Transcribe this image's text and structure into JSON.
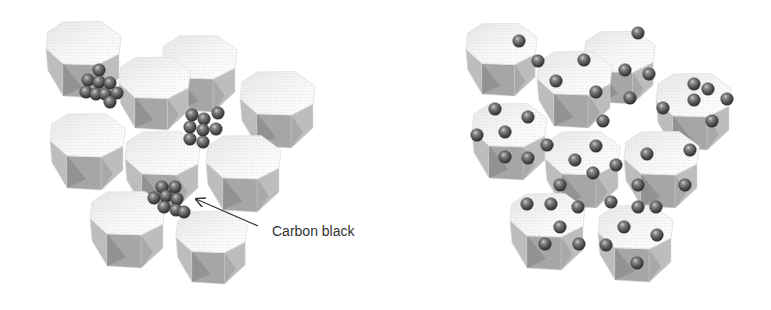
{
  "figure": {
    "annotation": {
      "label": "Carbon black"
    },
    "panels": [
      {
        "id": "agglomerated",
        "particles": [
          {
            "cx": 84,
            "cy": 58,
            "r": 40
          },
          {
            "cx": 200,
            "cy": 72,
            "r": 40
          },
          {
            "cx": 155,
            "cy": 92,
            "r": 38
          },
          {
            "cx": 278,
            "cy": 108,
            "r": 40
          },
          {
            "cx": 88,
            "cy": 150,
            "r": 40
          },
          {
            "cx": 163,
            "cy": 168,
            "r": 40
          },
          {
            "cx": 244,
            "cy": 172,
            "r": 40
          },
          {
            "cx": 128,
            "cy": 228,
            "r": 40
          },
          {
            "cx": 212,
            "cy": 246,
            "r": 38
          }
        ],
        "carbon_black": [
          {
            "x": 99,
            "y": 70
          },
          {
            "x": 88,
            "y": 80
          },
          {
            "x": 99,
            "y": 82
          },
          {
            "x": 110,
            "y": 83
          },
          {
            "x": 86,
            "y": 92
          },
          {
            "x": 96,
            "y": 94
          },
          {
            "x": 105,
            "y": 94
          },
          {
            "x": 117,
            "y": 93
          },
          {
            "x": 110,
            "y": 102
          },
          {
            "x": 192,
            "y": 115
          },
          {
            "x": 204,
            "y": 119
          },
          {
            "x": 218,
            "y": 113
          },
          {
            "x": 190,
            "y": 127
          },
          {
            "x": 203,
            "y": 130
          },
          {
            "x": 216,
            "y": 129
          },
          {
            "x": 190,
            "y": 139
          },
          {
            "x": 203,
            "y": 142
          },
          {
            "x": 162,
            "y": 187
          },
          {
            "x": 175,
            "y": 187
          },
          {
            "x": 154,
            "y": 198
          },
          {
            "x": 166,
            "y": 196
          },
          {
            "x": 177,
            "y": 199
          },
          {
            "x": 164,
            "y": 207
          },
          {
            "x": 176,
            "y": 210
          },
          {
            "x": 184,
            "y": 212
          }
        ]
      },
      {
        "id": "dispersed",
        "particles": [
          {
            "cx": 502,
            "cy": 58,
            "r": 38
          },
          {
            "cx": 620,
            "cy": 66,
            "r": 38
          },
          {
            "cx": 575,
            "cy": 88,
            "r": 40
          },
          {
            "cx": 694,
            "cy": 110,
            "r": 40
          },
          {
            "cx": 510,
            "cy": 140,
            "r": 40
          },
          {
            "cx": 583,
            "cy": 168,
            "r": 40
          },
          {
            "cx": 662,
            "cy": 168,
            "r": 40
          },
          {
            "cx": 548,
            "cy": 230,
            "r": 40
          },
          {
            "cx": 636,
            "cy": 242,
            "r": 40
          }
        ],
        "carbon_black": [
          {
            "x": 519,
            "y": 41
          },
          {
            "x": 638,
            "y": 33
          },
          {
            "x": 538,
            "y": 61
          },
          {
            "x": 584,
            "y": 60
          },
          {
            "x": 556,
            "y": 81
          },
          {
            "x": 596,
            "y": 92
          },
          {
            "x": 625,
            "y": 70
          },
          {
            "x": 649,
            "y": 74
          },
          {
            "x": 630,
            "y": 98
          },
          {
            "x": 603,
            "y": 121
          },
          {
            "x": 694,
            "y": 84
          },
          {
            "x": 708,
            "y": 89
          },
          {
            "x": 694,
            "y": 100
          },
          {
            "x": 727,
            "y": 99
          },
          {
            "x": 663,
            "y": 108
          },
          {
            "x": 712,
            "y": 121
          },
          {
            "x": 495,
            "y": 109
          },
          {
            "x": 528,
            "y": 117
          },
          {
            "x": 505,
            "y": 132
          },
          {
            "x": 477,
            "y": 135
          },
          {
            "x": 505,
            "y": 157
          },
          {
            "x": 528,
            "y": 158
          },
          {
            "x": 547,
            "y": 145
          },
          {
            "x": 596,
            "y": 146
          },
          {
            "x": 575,
            "y": 160
          },
          {
            "x": 616,
            "y": 165
          },
          {
            "x": 593,
            "y": 173
          },
          {
            "x": 647,
            "y": 154
          },
          {
            "x": 690,
            "y": 150
          },
          {
            "x": 638,
            "y": 185
          },
          {
            "x": 685,
            "y": 185
          },
          {
            "x": 560,
            "y": 185
          },
          {
            "x": 527,
            "y": 204
          },
          {
            "x": 551,
            "y": 204
          },
          {
            "x": 578,
            "y": 207
          },
          {
            "x": 560,
            "y": 227
          },
          {
            "x": 545,
            "y": 244
          },
          {
            "x": 579,
            "y": 244
          },
          {
            "x": 611,
            "y": 202
          },
          {
            "x": 638,
            "y": 207
          },
          {
            "x": 656,
            "y": 207
          },
          {
            "x": 624,
            "y": 227
          },
          {
            "x": 657,
            "y": 235
          },
          {
            "x": 606,
            "y": 245
          },
          {
            "x": 637,
            "y": 263
          }
        ]
      }
    ],
    "arrow": {
      "x1": 258,
      "y1": 226,
      "x2": 196,
      "y2": 199
    },
    "label_position": {
      "x": 272,
      "y": 236
    },
    "colors": {
      "top_face": "#f2f2f2",
      "side_light": "#bdbdbd",
      "side_mid": "#a6a6a6",
      "side_dark": "#8e8e8e",
      "outline": "#d9d9d9",
      "sphere_dark": "#3d3d3d",
      "sphere_mid": "#6e6e6e",
      "sphere_light": "#c8c8c8",
      "arrow": "#333333"
    }
  }
}
